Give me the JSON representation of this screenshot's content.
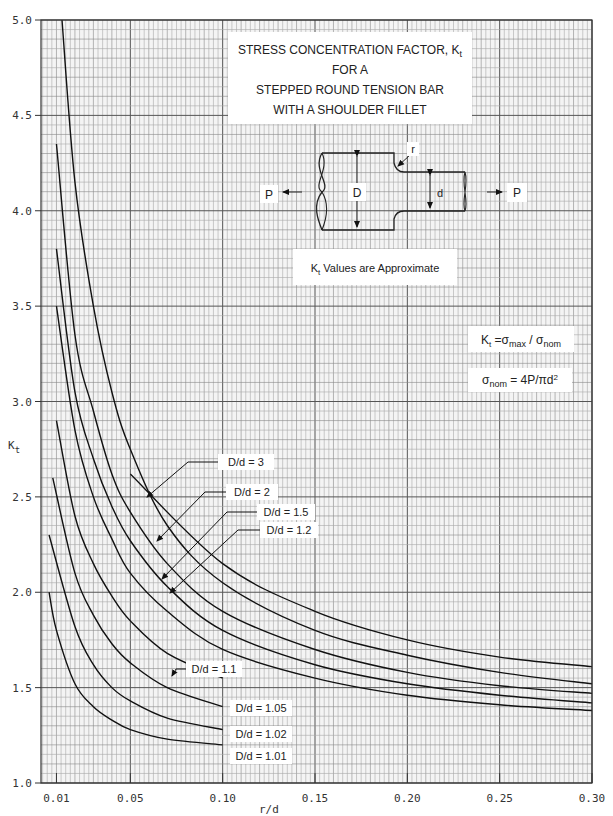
{
  "chart_data": {
    "type": "line",
    "title_lines": [
      "STRESS CONCENTRATION FACTOR, K",
      "FOR A",
      "STEPPED ROUND TENSION BAR",
      "WITH A SHOULDER FILLET"
    ],
    "title_subscript": "t",
    "xlabel": "r/d",
    "ylabel": "K",
    "ylabel_subscript": "t",
    "xlim": [
      0,
      0.3
    ],
    "ylim": [
      1.0,
      5.0
    ],
    "xticks": [
      "0.01",
      "0.05",
      "0.10",
      "0.15",
      "0.20",
      "0.25",
      "0.30"
    ],
    "xtick_values": [
      0.01,
      0.05,
      0.1,
      0.15,
      0.2,
      0.25,
      0.3
    ],
    "yticks": [
      "1.0",
      "1.5",
      "2.0",
      "2.5",
      "3.0",
      "3.5",
      "4.0",
      "4.5",
      "5.0"
    ],
    "ytick_values": [
      1.0,
      1.5,
      2.0,
      2.5,
      3.0,
      3.5,
      4.0,
      4.5,
      5.0
    ],
    "grid": true,
    "note": "Kt Values are Approximate",
    "formulas": [
      "Kt = σmax / σnom",
      "σnom = 4P/πd²"
    ],
    "diagram_labels": {
      "P_left": "P",
      "P_right": "P",
      "D": "D",
      "d": "d",
      "r": "r"
    },
    "series": [
      {
        "name": "D/d = 3",
        "x": [
          0.013,
          0.02,
          0.03,
          0.04,
          0.05,
          0.07,
          0.1,
          0.15,
          0.2,
          0.25,
          0.3
        ],
        "values": [
          5.0,
          4.15,
          3.5,
          3.05,
          2.75,
          2.35,
          2.05,
          1.8,
          1.67,
          1.58,
          1.52
        ]
      },
      {
        "name": "D/d = 2",
        "x": [
          0.01,
          0.02,
          0.03,
          0.04,
          0.05,
          0.07,
          0.1,
          0.15,
          0.2,
          0.25,
          0.3
        ],
        "values": [
          4.35,
          3.35,
          2.95,
          2.62,
          2.42,
          2.15,
          1.9,
          1.7,
          1.58,
          1.51,
          1.47
        ]
      },
      {
        "name": "D/d = 1.5",
        "x": [
          0.01,
          0.02,
          0.03,
          0.04,
          0.05,
          0.07,
          0.1,
          0.15,
          0.2,
          0.25,
          0.3
        ],
        "values": [
          3.8,
          3.05,
          2.7,
          2.45,
          2.27,
          2.03,
          1.8,
          1.62,
          1.52,
          1.46,
          1.42
        ]
      },
      {
        "name": "D/d = 1.2",
        "x": [
          0.01,
          0.02,
          0.03,
          0.04,
          0.05,
          0.07,
          0.1,
          0.15,
          0.2,
          0.25,
          0.3
        ],
        "values": [
          3.5,
          2.85,
          2.5,
          2.28,
          2.1,
          1.9,
          1.7,
          1.55,
          1.46,
          1.41,
          1.38
        ]
      },
      {
        "name": "D/d = 1.1",
        "x": [
          0.01,
          0.02,
          0.03,
          0.04,
          0.05,
          0.07,
          0.1
        ],
        "values": [
          2.9,
          2.4,
          2.15,
          1.98,
          1.85,
          1.68,
          1.55
        ]
      },
      {
        "name": "D/d = 1.05",
        "x": [
          0.008,
          0.02,
          0.03,
          0.04,
          0.05,
          0.07,
          0.1
        ],
        "values": [
          2.6,
          2.1,
          1.88,
          1.73,
          1.63,
          1.5,
          1.4
        ]
      },
      {
        "name": "D/d = 1.02",
        "x": [
          0.006,
          0.02,
          0.03,
          0.04,
          0.05,
          0.07,
          0.1
        ],
        "values": [
          2.3,
          1.82,
          1.62,
          1.5,
          1.43,
          1.34,
          1.28
        ]
      },
      {
        "name": "D/d = 1.01",
        "x": [
          0.006,
          0.01,
          0.02,
          0.03,
          0.04,
          0.05,
          0.07,
          0.1
        ],
        "values": [
          2.0,
          1.8,
          1.52,
          1.4,
          1.33,
          1.28,
          1.23,
          1.2
        ]
      }
    ],
    "extra_line": {
      "name": "D/d = 3 upper (continued)",
      "x": [
        0.05,
        0.1,
        0.15,
        0.2,
        0.25,
        0.3
      ],
      "values": [
        2.62,
        2.15,
        1.9,
        1.75,
        1.66,
        1.61
      ]
    }
  },
  "labels": {
    "dd3": "D/d = 3",
    "dd2": "D/d = 2",
    "dd15": "D/d = 1.5",
    "dd12": "D/d = 1.2",
    "dd11": "D/d = 1.1",
    "dd105": "D/d = 1.05",
    "dd102": "D/d = 1.02",
    "dd101": "D/d = 1.01"
  }
}
